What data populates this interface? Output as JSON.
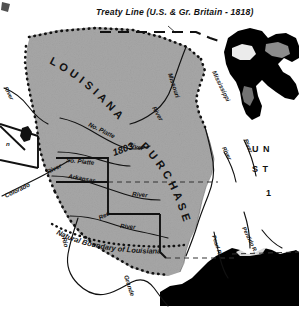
{
  "figure": {
    "kind": "historical-map",
    "width": 299,
    "height": 322
  },
  "colors": {
    "purchase_fill": "#b7b7b7",
    "land_white": "#ffffff",
    "ink": "#111111",
    "water_black": "#000000",
    "page": "#ffffff"
  },
  "labels": {
    "treaty_line": "Treaty Line (U.S. & Gr. Britain - 1818)",
    "louisiana": "L O U I S I A N A",
    "purchase": "P U R C H A S E",
    "year": "1803",
    "natural_boundary": "Natural Boundary of Louisiana",
    "united_states_line1": "U N",
    "united_states_line2": "S T",
    "united_states_line3": "1"
  },
  "rivers": [
    {
      "name": "No. Platte",
      "suffix": "River"
    },
    {
      "name": "So. Platte",
      "suffix": ""
    },
    {
      "name": "Missouri",
      "suffix": "River"
    },
    {
      "name": "Mississippi",
      "suffix": ""
    },
    {
      "name": "Arkansas",
      "suffix": "River"
    },
    {
      "name": "Red",
      "suffix": "River"
    },
    {
      "name": "Colorado",
      "suffix": "River"
    },
    {
      "name": "Rio",
      "suffix": "Grande"
    },
    {
      "name": "Pearl R.",
      "suffix": ""
    },
    {
      "name": "Perdido R.",
      "suffix": ""
    },
    {
      "name": "River",
      "suffix": ""
    }
  ],
  "river_labels": {
    "no_platte": "No. Platte",
    "no_platte_river": "River",
    "so_platte": "So. Platte",
    "missouri": "Missouri",
    "missouri_river": "River",
    "mississippi": "Mississippi",
    "arkansas": "Arkansas",
    "arkansas_river": "River",
    "red": "Red",
    "red_river": "River",
    "colorado": "Colorado",
    "colorado_river": "River",
    "rio": "Rio",
    "grande": "Grande",
    "pearl": "Pearl R.",
    "perdido": "Perdido R.",
    "left_river": "River",
    "east_river_1": "River",
    "east_river_2": "River",
    "state_fragment": "n"
  },
  "legend": {
    "dotted_meaning": "Louisiana Purchase boundary (dotted)",
    "dashed_meaning": "Treaty / survey line (dashed)",
    "black_meaning": "Water bodies (Great Lakes, Gulf of Mexico)"
  }
}
